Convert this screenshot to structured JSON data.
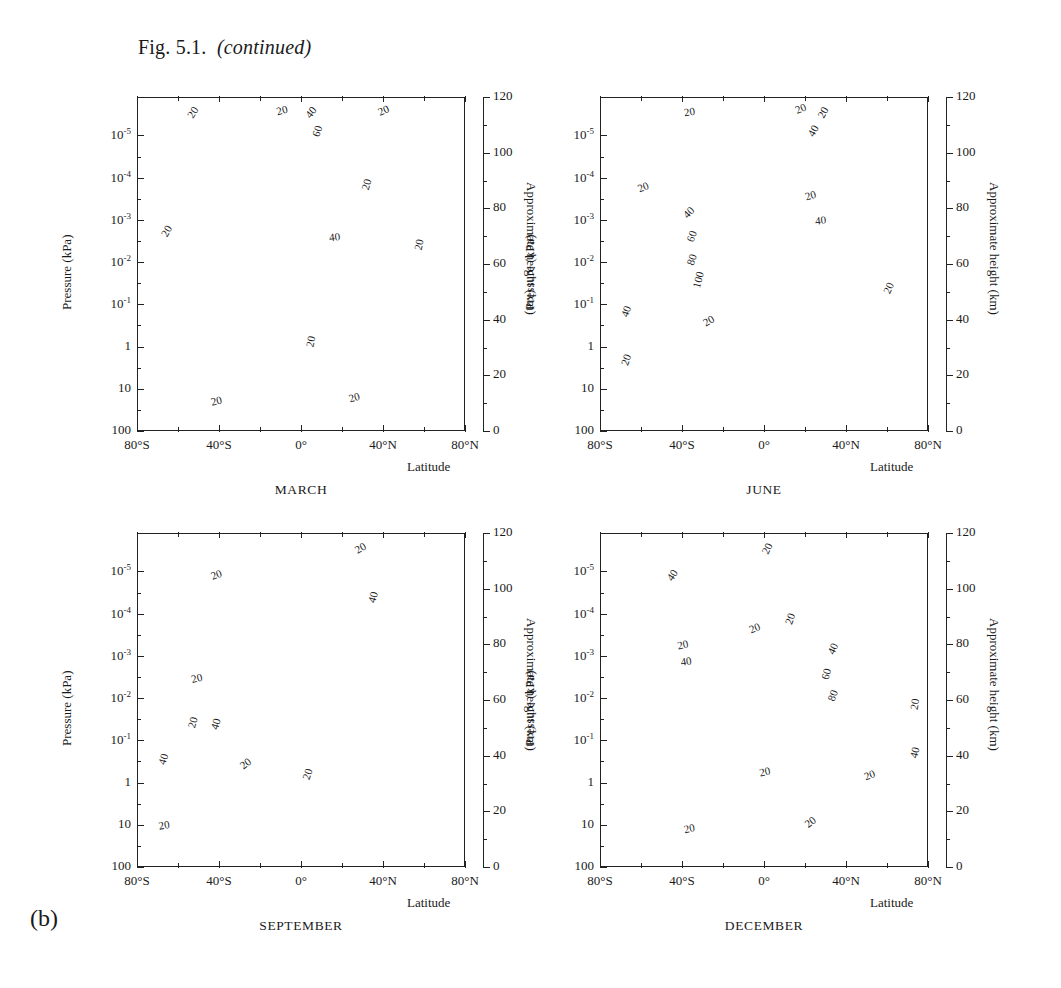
{
  "figure": {
    "caption_main": "Fig. 5.1.",
    "caption_italic": "(continued)",
    "panel_letter": "(b)"
  },
  "axes": {
    "y_title": "Pressure (kPa)",
    "y_ticks": [
      "10-5",
      "10-4",
      "10-3",
      "10-2",
      "10-1",
      "1",
      "10",
      "100"
    ],
    "y_ticks_display": [
      {
        "mant": "10",
        "exp": "-5"
      },
      {
        "mant": "10",
        "exp": "-4"
      },
      {
        "mant": "10",
        "exp": "-3"
      },
      {
        "mant": "10",
        "exp": "-2"
      },
      {
        "mant": "10",
        "exp": "-1"
      },
      {
        "mant": "1",
        "exp": ""
      },
      {
        "mant": "10",
        "exp": ""
      },
      {
        "mant": "100",
        "exp": ""
      }
    ],
    "x_title": "Latitude",
    "x_ticks": [
      "80°S",
      "40°S",
      "0°",
      "40°N",
      "80°N"
    ],
    "right_title": "Approximate height (km)",
    "right_ticks": [
      "0",
      "20",
      "40",
      "60",
      "80",
      "100",
      "120"
    ]
  },
  "panels": [
    {
      "id": "march",
      "title": "MARCH"
    },
    {
      "id": "june",
      "title": "JUNE"
    },
    {
      "id": "september",
      "title": "SEPTEMBER"
    },
    {
      "id": "december",
      "title": "DECEMBER"
    }
  ],
  "chart_data": {
    "type": "contour",
    "xlabel": "Latitude",
    "ylabel": "Pressure (kPa)",
    "y2label": "Approximate height (km)",
    "xlim": [
      -90,
      90
    ],
    "ylim_pressure_kpa": [
      100,
      3e-06
    ],
    "ylim_height_km": [
      0,
      120
    ],
    "yscale": "log-inverted",
    "grid": false,
    "legend": "none",
    "units": "m s-1",
    "contour_interval": 10,
    "line_styles": {
      "positive": "thin solid",
      "zero": "thick solid",
      "negative": "dotted"
    },
    "panels": [
      {
        "name": "MARCH",
        "labelled_contours": [
          20,
          40,
          60,
          -20
        ],
        "features": [
          {
            "type": "max",
            "label": 60,
            "approx_latitude": 0,
            "approx_height_km": 103,
            "note": "equatorial mesospheric/thermospheric westerly max"
          },
          {
            "type": "max",
            "label": 40,
            "approx_latitude": 20,
            "approx_height_km": 60
          },
          {
            "type": "min",
            "label": -20,
            "approx_latitude": -10,
            "approx_height_km": 30,
            "note": "dotted easterly core near 1 kPa"
          },
          {
            "type": "max",
            "label": 20,
            "approx_latitude": -45,
            "approx_height_km": 12
          },
          {
            "type": "max",
            "label": 20,
            "approx_latitude": 40,
            "approx_height_km": 13
          }
        ]
      },
      {
        "name": "JUNE",
        "labelled_contours": [
          20,
          40,
          60,
          80,
          100,
          -20,
          -40
        ],
        "features": [
          {
            "type": "max",
            "label": 100,
            "approx_latitude": -45,
            "approx_height_km": 55,
            "note": "winter-hemisphere stratospheric jet"
          },
          {
            "type": "max",
            "label": 40,
            "approx_latitude": 35,
            "approx_height_km": 104
          },
          {
            "type": "min",
            "label": -40,
            "approx_latitude": 25,
            "approx_height_km": 70,
            "note": "summer-hemisphere easterlies"
          },
          {
            "type": "min",
            "label": -20,
            "approx_latitude": -40,
            "approx_height_km": 110
          },
          {
            "type": "max",
            "label": 20,
            "approx_latitude": 40,
            "approx_height_km": 13
          }
        ]
      },
      {
        "name": "SEPTEMBER",
        "labelled_contours": [
          20,
          40,
          -20
        ],
        "features": [
          {
            "type": "max",
            "label": 40,
            "approx_latitude": 40,
            "approx_height_km": 104
          },
          {
            "type": "max",
            "label": 40,
            "approx_latitude": -45,
            "approx_height_km": 60
          },
          {
            "type": "max",
            "label": 40,
            "approx_latitude": -50,
            "approx_height_km": 30
          },
          {
            "type": "min",
            "label": -20,
            "approx_latitude": 0,
            "approx_height_km": 30
          },
          {
            "type": "min",
            "label": -20,
            "approx_latitude": -5,
            "approx_height_km": 82
          },
          {
            "type": "max",
            "label": 20,
            "approx_latitude": 40,
            "approx_height_km": 12
          }
        ]
      },
      {
        "name": "DECEMBER",
        "labelled_contours": [
          20,
          40,
          60,
          80,
          -20,
          -40
        ],
        "features": [
          {
            "type": "max",
            "label": 80,
            "approx_latitude": 40,
            "approx_height_km": 60,
            "note": "northern winter stratospheric jet"
          },
          {
            "type": "max",
            "label": 40,
            "approx_latitude": -40,
            "approx_height_km": 104
          },
          {
            "type": "min",
            "label": -40,
            "approx_latitude": -35,
            "approx_height_km": 75,
            "note": "summer easterlies"
          },
          {
            "type": "min",
            "label": -20,
            "approx_latitude": -25,
            "approx_height_km": 45
          },
          {
            "type": "max",
            "label": 20,
            "approx_latitude": -45,
            "approx_height_km": 13
          },
          {
            "type": "max",
            "label": 20,
            "approx_latitude": 38,
            "approx_height_km": 13
          }
        ]
      }
    ]
  }
}
